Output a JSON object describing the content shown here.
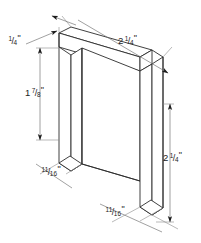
{
  "drawing": {
    "type": "isometric-technical-drawing",
    "subject": "U-shaped channel bracket",
    "background_color": "#ffffff",
    "line_color": "#2b2b2b",
    "dimension_line_color": "#6d6d6d",
    "text_color": "#1c1c1c",
    "canvas": {
      "width": 201,
      "height": 243
    }
  },
  "dimensions": [
    {
      "id": "thickness",
      "label": "1/4\"",
      "whole": "",
      "numerator": "1",
      "denominator": "4",
      "unit": "\"",
      "value": 0.25,
      "units": "inches",
      "describes": "material thickness at top face",
      "position": "top-left",
      "orientation": "diagonal-leader"
    },
    {
      "id": "depth-top",
      "label": "2 1/4\"",
      "whole": "2",
      "numerator": "1",
      "denominator": "4",
      "unit": "\"",
      "value": 2.25,
      "units": "inches",
      "describes": "overall width across top bar",
      "position": "top-right",
      "orientation": "diagonal"
    },
    {
      "id": "inner-height",
      "label": "1 7/8\"",
      "whole": "1",
      "numerator": "7",
      "denominator": "8",
      "unit": "\"",
      "value": 1.875,
      "units": "inches",
      "describes": "inner opening height of channel",
      "position": "left",
      "orientation": "vertical"
    },
    {
      "id": "leg-width-left",
      "label": "11/16\"",
      "whole": "",
      "numerator": "11",
      "denominator": "16",
      "unit": "\"",
      "value": 0.6875,
      "units": "inches",
      "describes": "left leg depth at base",
      "position": "lower-left",
      "orientation": "diagonal"
    },
    {
      "id": "overall-height",
      "label": "2 1/4\"",
      "whole": "2",
      "numerator": "1",
      "denominator": "4",
      "unit": "\"",
      "value": 2.25,
      "units": "inches",
      "describes": "overall height of bracket",
      "position": "right",
      "orientation": "vertical"
    },
    {
      "id": "leg-width-right",
      "label": "11/16\"",
      "whole": "",
      "numerator": "11",
      "denominator": "16",
      "unit": "\"",
      "value": 0.6875,
      "units": "inches",
      "describes": "right leg depth at base",
      "position": "bottom-center",
      "orientation": "diagonal"
    }
  ]
}
